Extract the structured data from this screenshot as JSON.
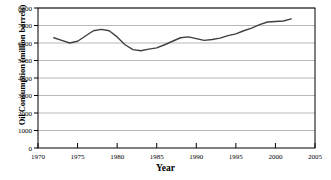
{
  "chart_data": {
    "type": "line",
    "title": "",
    "xlabel": "Year",
    "ylabel": "Oil Consumption (million barrels)",
    "xlim": [
      1970,
      2005
    ],
    "ylim": [
      0,
      8000
    ],
    "xticks": [
      1970,
      1975,
      1980,
      1985,
      1990,
      1995,
      2000,
      2005
    ],
    "yticks": [
      0,
      1000,
      2000,
      3000,
      4000,
      5000,
      6000,
      7000,
      8000
    ],
    "grid": true,
    "legend": false,
    "line_color": "#404040",
    "x": [
      1972,
      1973,
      1974,
      1975,
      1976,
      1977,
      1978,
      1979,
      1980,
      1981,
      1982,
      1983,
      1984,
      1985,
      1986,
      1987,
      1988,
      1989,
      1990,
      1991,
      1992,
      1993,
      1994,
      1995,
      1996,
      1997,
      1998,
      1999,
      2000,
      2001,
      2002
    ],
    "values": [
      6300,
      6150,
      6000,
      6100,
      6400,
      6700,
      6780,
      6700,
      6350,
      5900,
      5620,
      5560,
      5650,
      5720,
      5900,
      6100,
      6300,
      6350,
      6250,
      6150,
      6200,
      6280,
      6420,
      6520,
      6700,
      6850,
      7050,
      7200,
      7230,
      7260,
      7380
    ]
  },
  "axis": {
    "ytick_labels": [
      "8000",
      "7000",
      "6000",
      "5000",
      "4000",
      "3000",
      "2000",
      "1000",
      "0"
    ],
    "xtick_labels": [
      "1970",
      "1975",
      "1980",
      "1985",
      "1990",
      "1995",
      "2000",
      "2005"
    ]
  },
  "colors": {
    "line": "#404040",
    "grid": "#a6a6a6",
    "axis": "#000000",
    "background": "#ffffff"
  }
}
